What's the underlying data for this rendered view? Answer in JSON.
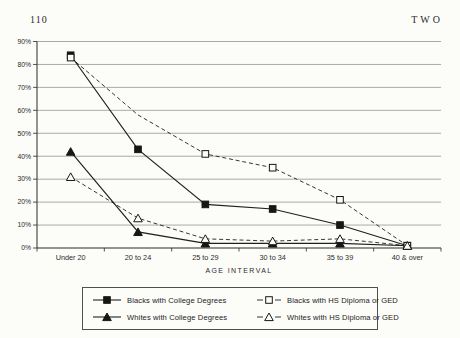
{
  "page": {
    "page_number": "110",
    "chapter_header": "TWO"
  },
  "colors": {
    "ink": "#1f1f1f",
    "grid": "#8d8d8d",
    "paper": "#fcfcf9",
    "text": "#2b2b2b"
  },
  "chart_data": {
    "type": "line",
    "title": "",
    "xlabel": "AGE INTERVAL",
    "ylabel": "",
    "categories": [
      "Under 20",
      "20 to 24",
      "25 to 29",
      "30 to 34",
      "35 to 39",
      "40 & over"
    ],
    "y_ticks": [
      "90%",
      "80%",
      "70%",
      "60%",
      "50%",
      "40%",
      "30%",
      "20%",
      "10%",
      "0%"
    ],
    "ylim": [
      0,
      90
    ],
    "grid": true,
    "legend_position": "bottom",
    "series": [
      {
        "name": "Blacks with College Degrees",
        "line": "solid",
        "marker": "filled-square",
        "values": [
          84,
          43,
          19,
          17,
          10,
          1
        ]
      },
      {
        "name": "Blacks with HS Diploma or GED",
        "line": "dashed",
        "marker": "open-square",
        "values": [
          83,
          58,
          41,
          35,
          21,
          1
        ],
        "marker_hidden_at": [
          1
        ]
      },
      {
        "name": "Whites with College Degrees",
        "line": "solid",
        "marker": "filled-triangle",
        "values": [
          42,
          7,
          2,
          2,
          2,
          1
        ]
      },
      {
        "name": "Whites with HS Diploma or GED",
        "line": "dashed",
        "marker": "open-triangle",
        "values": [
          31,
          13,
          4,
          3,
          4,
          1
        ]
      }
    ]
  }
}
